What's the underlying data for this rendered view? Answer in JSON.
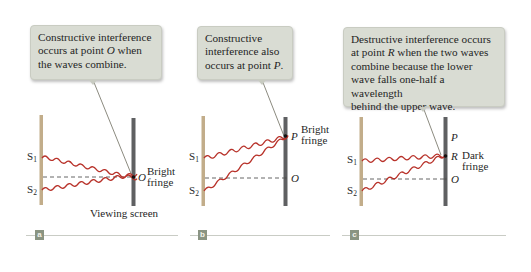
{
  "figure": {
    "panels": [
      {
        "id": "a",
        "tag": "a",
        "callout": {
          "line1": "Constructive interference",
          "line2_pre": "occurs at point ",
          "line2_point": "O",
          "line2_post": " when",
          "line3": "the waves combine."
        },
        "labels": {
          "s1": "S",
          "s1_sub": "1",
          "s2": "S",
          "s2_sub": "2",
          "point": "O",
          "fringe_line1": "Bright",
          "fringe_line2": "fringe",
          "screen": "Viewing screen"
        }
      },
      {
        "id": "b",
        "tag": "b",
        "callout": {
          "line1": "Constructive",
          "line2": "interference also",
          "line3_pre": "occurs at point ",
          "line3_point": "P",
          "line3_post": "."
        },
        "labels": {
          "s1": "S",
          "s1_sub": "1",
          "s2": "S",
          "s2_sub": "2",
          "point_p": "P",
          "point_o": "O",
          "fringe_line1": "Bright",
          "fringe_line2": "fringe"
        }
      },
      {
        "id": "c",
        "tag": "c",
        "callout": {
          "line1": "Destructive interference occurs",
          "line2_pre": "at point ",
          "line2_point": "R",
          "line2_post": " when the two waves",
          "line3": "combine because the lower",
          "line4": "wave falls one-half a wavelength",
          "line5": "behind the upper wave."
        },
        "labels": {
          "s1": "S",
          "s1_sub": "1",
          "s2": "S",
          "s2_sub": "2",
          "point_p": "P",
          "point_r": "R",
          "point_o": "O",
          "fringe_line1": "Dark",
          "fringe_line2": "fringe"
        }
      }
    ],
    "colors": {
      "wave": "#b8322a",
      "barrier": "#c2ad8a",
      "screen": "#5f6062",
      "callout_bg": "#d9dcd3",
      "tag_bg": "#8a9482",
      "rule": "#c9ccc5"
    }
  }
}
